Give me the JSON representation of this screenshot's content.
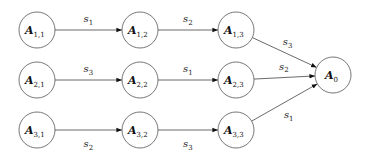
{
  "diagram": {
    "type": "directed-graph",
    "nodes": [
      {
        "id": "A11",
        "base": "A",
        "sub": "1,1",
        "x": 37,
        "y": 30
      },
      {
        "id": "A12",
        "base": "A",
        "sub": "1,2",
        "x": 140,
        "y": 30
      },
      {
        "id": "A13",
        "base": "A",
        "sub": "1,3",
        "x": 236,
        "y": 30
      },
      {
        "id": "A21",
        "base": "A",
        "sub": "2,1",
        "x": 37,
        "y": 80
      },
      {
        "id": "A22",
        "base": "A",
        "sub": "2,2",
        "x": 140,
        "y": 80
      },
      {
        "id": "A23",
        "base": "A",
        "sub": "2,3",
        "x": 236,
        "y": 80
      },
      {
        "id": "A31",
        "base": "A",
        "sub": "3,1",
        "x": 37,
        "y": 130
      },
      {
        "id": "A32",
        "base": "A",
        "sub": "3,2",
        "x": 140,
        "y": 130
      },
      {
        "id": "A33",
        "base": "A",
        "sub": "3,3",
        "x": 236,
        "y": 130
      },
      {
        "id": "A0",
        "base": "A",
        "sub": "0",
        "x": 333,
        "y": 75
      }
    ],
    "edges": [
      {
        "from": "A11",
        "to": "A12",
        "base": "s",
        "sub": "1",
        "label_pos": "above"
      },
      {
        "from": "A12",
        "to": "A13",
        "base": "s",
        "sub": "2",
        "label_pos": "above"
      },
      {
        "from": "A13",
        "to": "A0",
        "base": "s",
        "sub": "3",
        "label_pos": "above"
      },
      {
        "from": "A21",
        "to": "A22",
        "base": "s",
        "sub": "3",
        "label_pos": "above"
      },
      {
        "from": "A22",
        "to": "A23",
        "base": "s",
        "sub": "1",
        "label_pos": "above"
      },
      {
        "from": "A23",
        "to": "A0",
        "base": "s",
        "sub": "2",
        "label_pos": "above"
      },
      {
        "from": "A31",
        "to": "A32",
        "base": "s",
        "sub": "2",
        "label_pos": "below"
      },
      {
        "from": "A32",
        "to": "A33",
        "base": "s",
        "sub": "3",
        "label_pos": "below"
      },
      {
        "from": "A33",
        "to": "A0",
        "base": "s",
        "sub": "1",
        "label_pos": "below"
      }
    ],
    "node_radius": 18,
    "colors": {
      "stroke": "#555555",
      "text": "#111111",
      "background": "#ffffff"
    }
  }
}
